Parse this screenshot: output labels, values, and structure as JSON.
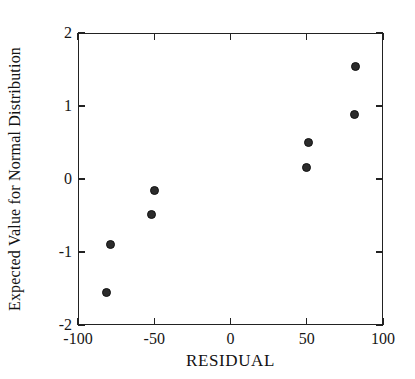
{
  "chart_data": {
    "type": "scatter",
    "title": "",
    "xlabel": "RESIDUAL",
    "ylabel": "Expected Value for Normal Distribution",
    "xlim": [
      -100,
      100
    ],
    "ylim": [
      -2,
      2
    ],
    "xticks": [
      -100,
      -50,
      0,
      50,
      100
    ],
    "yticks": [
      -2,
      -1,
      0,
      1,
      2
    ],
    "xticklabels": [
      "-100",
      "-50",
      "0",
      "50",
      "100"
    ],
    "yticklabels": [
      "-2",
      "-1",
      "0",
      "1",
      "2"
    ],
    "grid": false,
    "legend": null,
    "marker": "filled-circle",
    "marker_color": "#2b2b2b",
    "points": [
      {
        "x": -81,
        "y": -1.55
      },
      {
        "x": -79,
        "y": -0.9
      },
      {
        "x": -52,
        "y": -0.49
      },
      {
        "x": -50,
        "y": -0.16
      },
      {
        "x": 50,
        "y": 0.16
      },
      {
        "x": 51,
        "y": 0.5
      },
      {
        "x": 81,
        "y": 0.88
      },
      {
        "x": 82,
        "y": 1.54
      }
    ]
  },
  "axes": {
    "frame_color": "#222222"
  }
}
